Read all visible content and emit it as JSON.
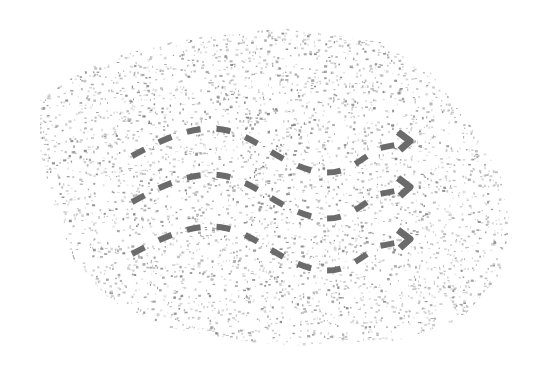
{
  "canvas": {
    "width": 548,
    "height": 373,
    "background": "#ffffff"
  },
  "texture": {
    "name": "speckled-blob",
    "speckle_color": "#7a7a7a",
    "speckle_color_light": "#b5b5b5",
    "outline": [
      [
        40,
        100
      ],
      [
        95,
        62
      ],
      [
        180,
        40
      ],
      [
        280,
        28
      ],
      [
        380,
        42
      ],
      [
        430,
        72
      ],
      [
        470,
        125
      ],
      [
        500,
        175
      ],
      [
        510,
        225
      ],
      [
        500,
        275
      ],
      [
        460,
        320
      ],
      [
        400,
        340
      ],
      [
        330,
        348
      ],
      [
        250,
        342
      ],
      [
        170,
        328
      ],
      [
        110,
        300
      ],
      [
        75,
        262
      ],
      [
        55,
        210
      ],
      [
        40,
        150
      ]
    ]
  },
  "arrows": {
    "color": "#6b6b6b",
    "stroke_width": 6,
    "dash": "14 16",
    "items": [
      {
        "name": "arrow-top",
        "offset_y": 0
      },
      {
        "name": "arrow-middle",
        "offset_y": 46
      },
      {
        "name": "arrow-bottom",
        "offset_y": 98
      }
    ],
    "path": "M 132 156 C 165 138, 195 124, 225 130 S 275 160, 310 170 S 360 158, 380 148 L 400 144",
    "head": "M 398 132 L 410 141 L 400 150"
  }
}
